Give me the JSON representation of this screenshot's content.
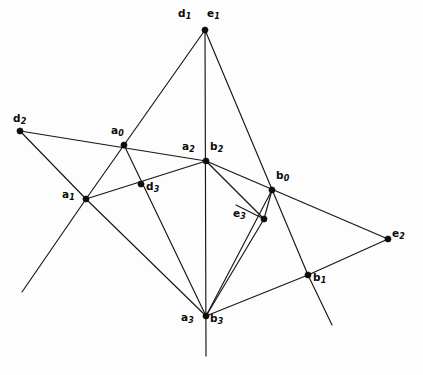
{
  "figure": {
    "background_color": "#fdfdfd",
    "line_color": "#161616",
    "vertex_color": "#0d0d0d",
    "width": 423,
    "height": 375
  },
  "vertices": [
    {
      "id": "de1",
      "label_main": "d",
      "label_sub": "1",
      "label2_main": "e",
      "label2_sub": "1",
      "x": 205,
      "y": 30,
      "label_x": 178,
      "label_y": 8,
      "label2_x": 207,
      "label2_y": 8
    },
    {
      "id": "d2",
      "label_main": "d",
      "label_sub": "2",
      "x": 20,
      "y": 131,
      "label_x": 13,
      "label_y": 113
    },
    {
      "id": "a0",
      "label_main": "a",
      "label_sub": "0",
      "x": 124,
      "y": 145,
      "label_x": 111,
      "label_y": 125
    },
    {
      "id": "ab2",
      "label_main": "a",
      "label_sub": "2",
      "label2_main": "b",
      "label2_sub": "2",
      "x": 206,
      "y": 161,
      "label_x": 182,
      "label_y": 141,
      "label2_x": 210,
      "label2_y": 141
    },
    {
      "id": "b0",
      "label_main": "b",
      "label_sub": "0",
      "x": 272,
      "y": 190,
      "label_x": 276,
      "label_y": 170
    },
    {
      "id": "a1",
      "label_main": "a",
      "label_sub": "1",
      "x": 86,
      "y": 199,
      "label_x": 62,
      "label_y": 189
    },
    {
      "id": "d3",
      "label_main": "d",
      "label_sub": "3",
      "x": 141,
      "y": 184,
      "label_x": 146,
      "label_y": 181
    },
    {
      "id": "e3",
      "label_main": "e",
      "label_sub": "3",
      "x": 264,
      "y": 219,
      "label_x": 233,
      "label_y": 208
    },
    {
      "id": "e2",
      "label_main": "e",
      "label_sub": "2",
      "x": 388,
      "y": 239,
      "label_x": 392,
      "label_y": 228
    },
    {
      "id": "b1",
      "label_main": "b",
      "label_sub": "1",
      "x": 308,
      "y": 275,
      "label_x": 313,
      "label_y": 272
    },
    {
      "id": "ab3",
      "label_main": "a",
      "label_sub": "3",
      "label2_main": "b",
      "label2_sub": "3",
      "x": 206,
      "y": 316,
      "label_x": 181,
      "label_y": 312,
      "label2_x": 210,
      "label2_y": 313
    }
  ],
  "edges": [
    {
      "name": "edge-apex-to-a1",
      "x1": 205,
      "y1": 30,
      "x2": 86,
      "y2": 199
    },
    {
      "name": "edge-apex-vertical",
      "x1": 205,
      "y1": 30,
      "x2": 206,
      "y2": 356
    },
    {
      "name": "edge-apex-to-b1",
      "x1": 205,
      "y1": 30,
      "x2": 308,
      "y2": 275
    },
    {
      "name": "edge-d2-to-ab2",
      "x1": 20,
      "y1": 131,
      "x2": 206,
      "y2": 161
    },
    {
      "name": "edge-d2-to-lowerleft",
      "x1": 20,
      "y1": 131,
      "x2": 86,
      "y2": 199
    },
    {
      "name": "edge-a1-extend-down",
      "x1": 86,
      "y1": 199,
      "x2": 22,
      "y2": 292
    },
    {
      "name": "edge-a1-to-d3-ab2",
      "x1": 86,
      "y1": 199,
      "x2": 206,
      "y2": 161
    },
    {
      "name": "edge-a1-to-ab3",
      "x1": 86,
      "y1": 199,
      "x2": 206,
      "y2": 316
    },
    {
      "name": "edge-a0-to-ab3",
      "x1": 124,
      "y1": 145,
      "x2": 206,
      "y2": 316
    },
    {
      "name": "edge-ab2-to-e2",
      "x1": 206,
      "y1": 161,
      "x2": 388,
      "y2": 239
    },
    {
      "name": "edge-ab2-to-e3",
      "x1": 206,
      "y1": 161,
      "x2": 264,
      "y2": 219
    },
    {
      "name": "edge-b0-to-ab3",
      "x1": 272,
      "y1": 190,
      "x2": 206,
      "y2": 316
    },
    {
      "name": "edge-e3-to-ab3",
      "x1": 264,
      "y1": 219,
      "x2": 206,
      "y2": 316
    },
    {
      "name": "edge-e3-to-b0",
      "x1": 264,
      "y1": 219,
      "x2": 272,
      "y2": 190
    },
    {
      "name": "edge-e2-to-b1",
      "x1": 388,
      "y1": 239,
      "x2": 308,
      "y2": 275
    },
    {
      "name": "edge-b1-to-ab3",
      "x1": 308,
      "y1": 275,
      "x2": 206,
      "y2": 316
    },
    {
      "name": "edge-b1-extend-down",
      "x1": 308,
      "y1": 275,
      "x2": 332,
      "y2": 325
    },
    {
      "name": "edge-e3-to-a1-cross",
      "x1": 264,
      "y1": 219,
      "x2": 236,
      "y2": 205
    }
  ]
}
